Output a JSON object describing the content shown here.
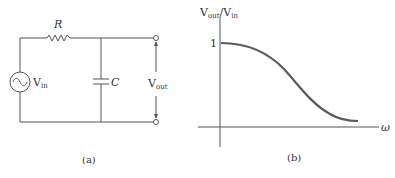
{
  "circuit": {
    "resistor_label": "R",
    "capacitor_label": "C",
    "source_label_main": "V",
    "source_label_sub": "in",
    "output_label_main": "V",
    "output_label_sub": "out",
    "caption": "(a)"
  },
  "graph": {
    "y_label_main1": "V",
    "y_label_sub1": "out",
    "y_label_slash": "/",
    "y_label_main2": "V",
    "y_label_sub2": "in",
    "y_tick_label": "1",
    "x_label": "ω",
    "caption": "(b)"
  },
  "colors": {
    "line": "#555555",
    "curve": "#5a5a5a",
    "text": "#333333"
  }
}
